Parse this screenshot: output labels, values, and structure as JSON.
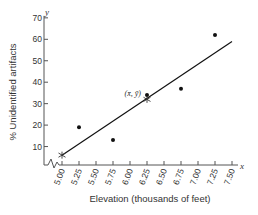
{
  "chart_data": {
    "type": "scatter",
    "title": "",
    "xlabel": "Elevation (thousands of feet)",
    "ylabel": "% Unidentified artifacts",
    "x_axis_letter": "x",
    "y_axis_letter": "y",
    "xlim": [
      5.0,
      7.5
    ],
    "ylim": [
      0,
      70
    ],
    "x_ticks": [
      "5.00",
      "5.25",
      "5.50",
      "5.75",
      "6.00",
      "6.25",
      "6.50",
      "6.75",
      "7.00",
      "7.25",
      "7.50"
    ],
    "y_ticks": [
      "10",
      "20",
      "30",
      "40",
      "50",
      "60",
      "70"
    ],
    "grid": false,
    "axis_break": true,
    "series": [
      {
        "name": "Observed data",
        "type": "scatter",
        "points": [
          {
            "x": 5.25,
            "y": 19
          },
          {
            "x": 5.75,
            "y": 13
          },
          {
            "x": 6.25,
            "y": 34
          },
          {
            "x": 6.75,
            "y": 37
          },
          {
            "x": 7.25,
            "y": 62
          }
        ]
      },
      {
        "name": "Least-squares regression line",
        "type": "line",
        "points": [
          {
            "x": 5.0,
            "y": 6
          },
          {
            "x": 7.5,
            "y": 59
          }
        ]
      }
    ],
    "annotations": [
      {
        "text": "(x̄, ȳ)",
        "x": 6.25,
        "y": 32,
        "marker": "star"
      },
      {
        "text": "",
        "x": 5.0,
        "y": 6,
        "marker": "star"
      }
    ]
  }
}
